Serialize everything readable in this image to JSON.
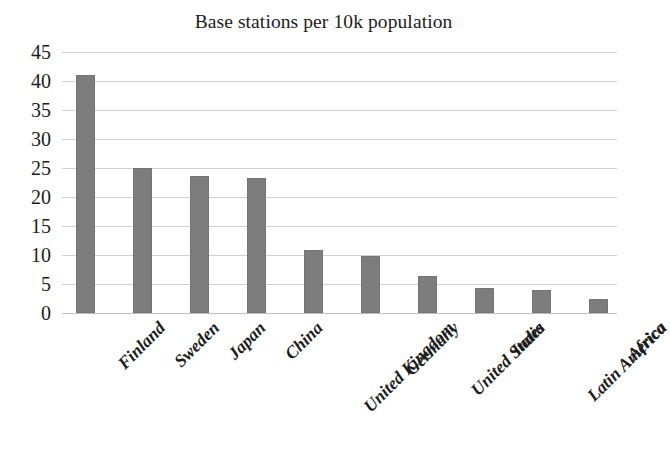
{
  "chart_data": {
    "type": "bar",
    "title": "Base stations per 10k population",
    "xlabel": "",
    "ylabel": "",
    "ylim": [
      0,
      45
    ],
    "yticks": [
      0,
      5,
      10,
      15,
      20,
      25,
      30,
      35,
      40,
      45
    ],
    "grid": true,
    "legend": "none",
    "orientation": "vertical",
    "bar_color": "#7d7d7d",
    "categories": [
      "Finland",
      "Sweden",
      "Japan",
      "China",
      "United Kingdom",
      "Germany",
      "United States",
      "India",
      "Latin America",
      "Africa"
    ],
    "values": [
      41,
      25,
      23.7,
      23.2,
      10.8,
      9.8,
      6.4,
      4.3,
      3.9,
      2.5
    ]
  },
  "axis": {
    "y_tick_labels": [
      "45",
      "40",
      "35",
      "30",
      "25",
      "20",
      "15",
      "10",
      "5",
      "0"
    ]
  }
}
